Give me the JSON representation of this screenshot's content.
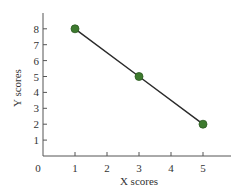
{
  "chart_data": {
    "type": "line",
    "title": "",
    "xlabel": "X scores",
    "ylabel": "Y scores",
    "x": [
      1,
      3,
      5
    ],
    "series": [
      {
        "name": "Y scores",
        "values": [
          8,
          5,
          2
        ],
        "marker": "circle",
        "marker_color": "#3d7a2e",
        "line_color": "#2b2b2b"
      }
    ],
    "xlim": [
      0,
      5.9
    ],
    "ylim": [
      0,
      9
    ],
    "xticks": [
      1,
      2,
      3,
      4,
      5
    ],
    "yticks": [
      1,
      2,
      3,
      4,
      5,
      6,
      7,
      8
    ],
    "origin_label": "0",
    "grid": false,
    "legend": false
  }
}
